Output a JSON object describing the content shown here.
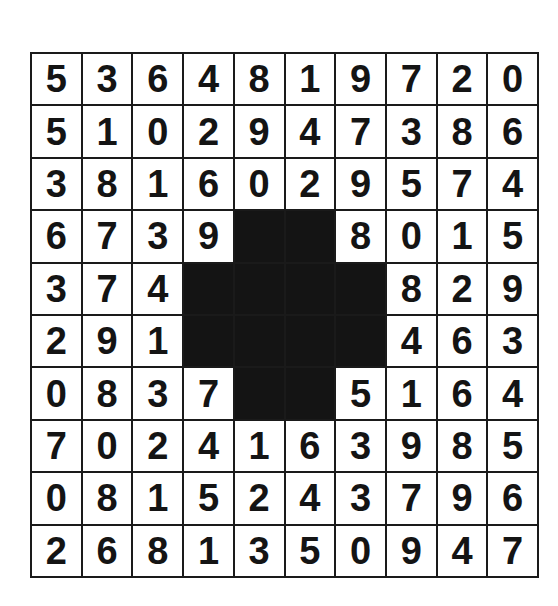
{
  "puzzle": {
    "rows": 10,
    "cols": 10,
    "colors": {
      "ink": "#141414",
      "paper": "#ffffff",
      "block": "#141414"
    },
    "grid": [
      [
        "5",
        "3",
        "6",
        "4",
        "8",
        "1",
        "9",
        "7",
        "2",
        "0"
      ],
      [
        "5",
        "1",
        "0",
        "2",
        "9",
        "4",
        "7",
        "3",
        "8",
        "6"
      ],
      [
        "3",
        "8",
        "1",
        "6",
        "0",
        "2",
        "9",
        "5",
        "7",
        "4"
      ],
      [
        "6",
        "7",
        "3",
        "9",
        "",
        "",
        "8",
        "0",
        "1",
        "5"
      ],
      [
        "3",
        "7",
        "4",
        "",
        "",
        "",
        "",
        "8",
        "2",
        "9"
      ],
      [
        "2",
        "9",
        "1",
        "",
        "",
        "",
        "",
        "4",
        "6",
        "3"
      ],
      [
        "0",
        "8",
        "3",
        "7",
        "",
        "",
        "5",
        "1",
        "6",
        "4"
      ],
      [
        "7",
        "0",
        "2",
        "4",
        "1",
        "6",
        "3",
        "9",
        "8",
        "5"
      ],
      [
        "0",
        "8",
        "1",
        "5",
        "2",
        "4",
        "3",
        "7",
        "9",
        "6"
      ],
      [
        "2",
        "6",
        "8",
        "1",
        "3",
        "5",
        "0",
        "9",
        "4",
        "7"
      ]
    ],
    "blocked_cells": [
      [
        3,
        4
      ],
      [
        3,
        5
      ],
      [
        4,
        3
      ],
      [
        4,
        4
      ],
      [
        4,
        5
      ],
      [
        4,
        6
      ],
      [
        5,
        3
      ],
      [
        5,
        4
      ],
      [
        5,
        5
      ],
      [
        5,
        6
      ],
      [
        6,
        4
      ],
      [
        6,
        5
      ]
    ]
  }
}
